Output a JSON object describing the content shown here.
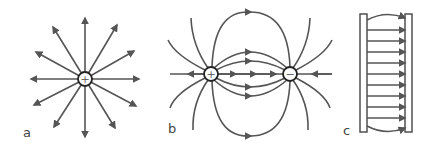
{
  "panels": [
    {
      "id": "a",
      "label": "a",
      "description": "Isolated positive point charge with radial outward field lines",
      "charge_sign": "+",
      "num_field_lines": 12
    },
    {
      "id": "b",
      "label": "b",
      "description": "Electric dipole: field lines from positive to negative charge",
      "charges": [
        {
          "sign": "+"
        },
        {
          "sign": "−"
        }
      ]
    },
    {
      "id": "c",
      "label": "c",
      "description": "Parallel plate capacitor with uniform field from positive plate to negative plate",
      "left_plate_sign": "+",
      "right_plate_sign": "−",
      "num_field_lines": 11
    }
  ],
  "colors": {
    "line": "#555555",
    "charge_outline": "#222222",
    "background": "#ffffff"
  }
}
